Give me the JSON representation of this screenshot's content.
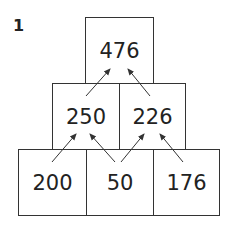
{
  "question_number": "1",
  "pyramid": {
    "top": [
      "476"
    ],
    "middle": [
      "250",
      "226"
    ],
    "bottom": [
      "200",
      "50",
      "176"
    ]
  },
  "colors": {
    "line": "#333333",
    "text": "#222222",
    "background": "#ffffff"
  }
}
